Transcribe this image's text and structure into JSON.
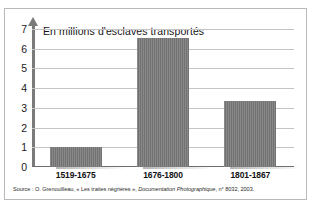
{
  "chart_data": {
    "type": "bar",
    "title": "",
    "axis_title": "En millions d'esclaves transportés",
    "categories": [
      "1519-1675",
      "1676-1800",
      "1801-1867"
    ],
    "values": [
      1.0,
      6.55,
      3.35
    ],
    "xlabel": "",
    "ylabel": "En millions d'esclaves transportés",
    "ylim": [
      0,
      7
    ],
    "ytick_labels": [
      "7",
      "6",
      "5",
      "4",
      "3",
      "2",
      "1",
      "0"
    ],
    "ytick_values": [
      7,
      6,
      5,
      4,
      3,
      2,
      1,
      0
    ],
    "grid": true,
    "legend": false,
    "bar_color": "#787878",
    "gridline_color": "#c4c4c4",
    "axis_color": "#7a7a7a"
  },
  "source": {
    "prefix": "Source : O. Grenouilleau, « Les traites négrières », ",
    "publication": "Documentation Photographique",
    "suffix": ", n° 8032, 2003."
  }
}
